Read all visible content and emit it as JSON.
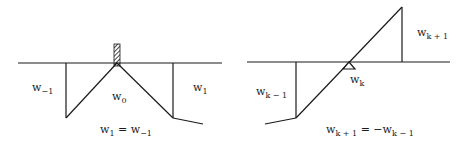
{
  "diagrams": [
    {
      "id": "symmetric-clamped",
      "labels": {
        "left_base": "w",
        "left_sub": "−1",
        "center_base": "w",
        "center_sub": "0",
        "right_base": "w",
        "right_sub": "1",
        "eq_lhs_base": "w",
        "eq_lhs_sub": "1",
        "eq_op": " = ",
        "eq_rhs_base": "w",
        "eq_rhs_sub": "−1"
      },
      "support": "hatched-wall"
    },
    {
      "id": "antisymmetric-pinned",
      "labels": {
        "left_base": "w",
        "left_sub": "k − 1",
        "center_base": "w",
        "center_sub": "k",
        "right_base": "w",
        "right_sub": "k + 1",
        "eq_lhs_base": "w",
        "eq_lhs_sub": "k + 1",
        "eq_op": " = −",
        "eq_rhs_base": "w",
        "eq_rhs_sub": "k − 1"
      },
      "support": "triangle-pin"
    }
  ],
  "colors": {
    "line": "#1a1a1a",
    "background": "#ffffff"
  }
}
